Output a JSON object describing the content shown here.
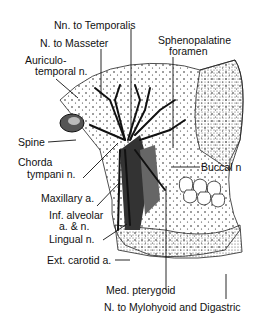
{
  "diagram": {
    "labels": {
      "nn_to_temporalis": "Nn. to Temporalis",
      "n_to_masseter": "N. to Masseter",
      "auriculotemporal_line1": "Auriculo-",
      "auriculotemporal_line2": "temporal n.",
      "sphenopalatine_line1": "Sphenopalatine",
      "sphenopalatine_line2": "foramen",
      "spine": "Spine",
      "chorda_line1": "Chorda",
      "chorda_line2": "tympani n.",
      "buccal": "Buccal n",
      "maxillary": "Maxillary a.",
      "inf_alveolar_line1": "Inf. alveolar",
      "inf_alveolar_line2": "a. & n.",
      "lingual": "Lingual n.",
      "ext_carotid": "Ext. carotid a.",
      "med_pterygoid": "Med. pterygoid",
      "mylohyoid": "N. to Mylohyoid and Digastric"
    }
  }
}
